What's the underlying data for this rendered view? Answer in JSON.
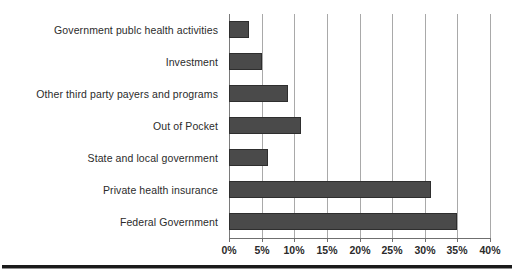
{
  "chart_data": {
    "type": "bar",
    "orientation": "horizontal",
    "title": "",
    "subtitle": "",
    "xlabel": "",
    "ylabel": "",
    "categories": [
      "Government publc health activities",
      "Investment",
      "Other third party payers and programs",
      "Out of Pocket",
      "State and local government",
      "Private health insurance",
      "Federal Government"
    ],
    "values": [
      3,
      5,
      9,
      11,
      6,
      31,
      35
    ],
    "value_suffix": "%",
    "xlim": [
      0,
      40
    ],
    "xticks": [
      0,
      5,
      10,
      15,
      20,
      25,
      30,
      35,
      40
    ],
    "xticklabels": [
      "0%",
      "5%",
      "10%",
      "15%",
      "20%",
      "25%",
      "30%",
      "35%",
      "40%"
    ],
    "grid": true,
    "grid_axis": "x",
    "legend": false,
    "legend_position": "none",
    "bar_color": "#4a4a4a",
    "bar_edge_color": "#2e2e2e",
    "gridline_color": "#a9a9a9",
    "axis_color": "#6f6f6f",
    "background_color": "#ffffff",
    "text_color": "#2b2b2b"
  }
}
